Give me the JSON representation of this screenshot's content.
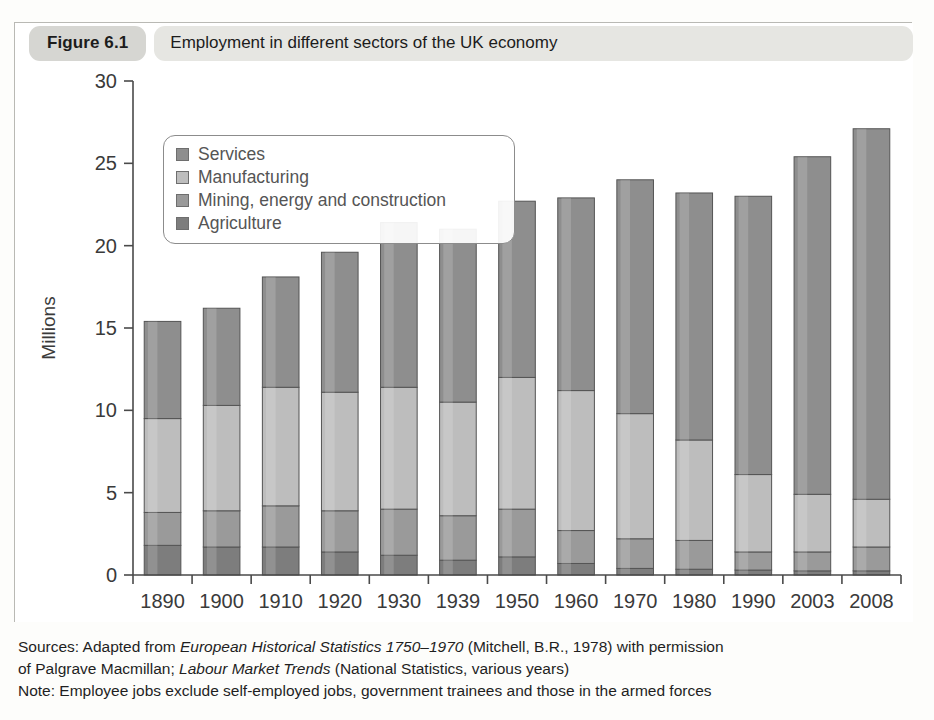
{
  "figure": {
    "tag": "Figure 6.1",
    "title": "Employment in different sectors of the UK economy"
  },
  "legend": {
    "position": "top-left-inside",
    "items": [
      {
        "label": "Services",
        "color": "#8e8e8e"
      },
      {
        "label": "Manufacturing",
        "color": "#bdbdbd"
      },
      {
        "label": "Mining, energy and construction",
        "color": "#9a9a9a"
      },
      {
        "label": "Agriculture",
        "color": "#7d7d7d"
      }
    ]
  },
  "notes": {
    "sources_line1_a": "Sources: Adapted from ",
    "sources_line1_italic": "European Historical Statistics 1750–1970",
    "sources_line1_b": " (Mitchell, B.R., 1978) with permission",
    "sources_line2_a": "of Palgrave Macmillan; ",
    "sources_line2_italic": "Labour Market Trends",
    "sources_line2_b": " (National Statistics, various years)",
    "note_line": "Note: Employee jobs exclude self-employed jobs, government trainees and those in the armed forces"
  },
  "chart_data": {
    "type": "bar",
    "stacked": true,
    "title": "Employment in different sectors of the UK economy",
    "xlabel": "",
    "ylabel": "Millions",
    "ylim": [
      0,
      30
    ],
    "yticks": [
      0,
      5,
      10,
      15,
      20,
      25,
      30
    ],
    "ytick_labels": [
      "0",
      "5",
      "10",
      "15",
      "20",
      "25",
      "30"
    ],
    "grid": false,
    "legend_position": "upper left",
    "categories": [
      "1890",
      "1900",
      "1910",
      "1920",
      "1930",
      "1939",
      "1950",
      "1960",
      "1970",
      "1980",
      "1990",
      "2003",
      "2008"
    ],
    "series": [
      {
        "name": "Agriculture",
        "color": "#7d7d7d",
        "values": [
          1.8,
          1.7,
          1.7,
          1.4,
          1.2,
          0.9,
          1.1,
          0.7,
          0.4,
          0.35,
          0.3,
          0.25,
          0.25
        ]
      },
      {
        "name": "Mining, energy and construction",
        "color": "#9a9a9a",
        "values": [
          2.0,
          2.2,
          2.5,
          2.5,
          2.8,
          2.7,
          2.9,
          2.0,
          1.8,
          1.75,
          1.1,
          1.15,
          1.45
        ]
      },
      {
        "name": "Manufacturing",
        "color": "#bdbdbd",
        "values": [
          5.7,
          6.4,
          7.2,
          7.2,
          7.4,
          6.9,
          8.0,
          8.5,
          7.6,
          6.1,
          4.7,
          3.5,
          2.9
        ]
      },
      {
        "name": "Services",
        "color": "#8e8e8e",
        "values": [
          5.9,
          5.9,
          6.7,
          8.5,
          10.0,
          10.5,
          10.7,
          11.7,
          14.2,
          15.0,
          16.9,
          20.5,
          22.5
        ]
      }
    ],
    "stack_tops": {
      "agriculture": [
        1.8,
        1.7,
        1.7,
        1.4,
        1.2,
        0.9,
        1.1,
        0.7,
        0.4,
        0.35,
        0.3,
        0.25,
        0.25
      ],
      "mining": [
        3.8,
        3.9,
        4.2,
        3.9,
        4.0,
        3.6,
        4.0,
        2.7,
        2.2,
        2.1,
        1.4,
        1.4,
        1.7
      ],
      "manufacturing": [
        9.5,
        10.3,
        11.4,
        11.1,
        11.4,
        10.5,
        12.0,
        11.2,
        9.8,
        8.2,
        6.1,
        4.9,
        4.6
      ],
      "total": [
        15.4,
        16.2,
        18.1,
        19.6,
        21.4,
        21.0,
        22.7,
        22.9,
        24.0,
        23.2,
        23.0,
        25.4,
        27.1
      ]
    }
  }
}
